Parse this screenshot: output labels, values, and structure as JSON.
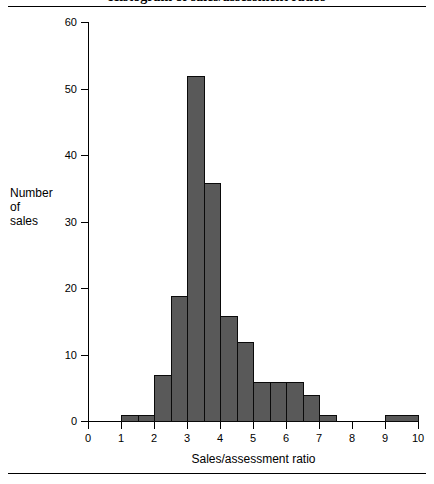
{
  "figure": {
    "title": "Histogram of sales/assessment ratios",
    "x_axis_title": "Sales/assessment ratio",
    "y_axis_title_lines": [
      "Number",
      "of",
      "sales"
    ],
    "bar_fill_color": "#595959",
    "bar_border_color": "#0a0a0a",
    "background_color": "#ffffff"
  },
  "chart_data": {
    "type": "bar",
    "title": "Histogram of sales/assessment ratios",
    "xlabel": "Sales/assessment ratio",
    "ylabel": "Number of sales",
    "xlim": [
      0,
      10
    ],
    "ylim": [
      0,
      60
    ],
    "xticks": [
      0,
      1,
      2,
      3,
      4,
      5,
      6,
      7,
      8,
      9,
      10
    ],
    "yticks": [
      0,
      10,
      20,
      30,
      40,
      50,
      60
    ],
    "grid": false,
    "legend": false,
    "bin_width": 0.5,
    "bins": [
      {
        "start": 1.0,
        "end": 1.5,
        "value": 1
      },
      {
        "start": 1.5,
        "end": 2.0,
        "value": 1
      },
      {
        "start": 2.0,
        "end": 2.5,
        "value": 7
      },
      {
        "start": 2.5,
        "end": 3.0,
        "value": 19
      },
      {
        "start": 3.0,
        "end": 3.5,
        "value": 52
      },
      {
        "start": 3.5,
        "end": 4.0,
        "value": 36
      },
      {
        "start": 4.0,
        "end": 4.5,
        "value": 16
      },
      {
        "start": 4.5,
        "end": 5.0,
        "value": 12
      },
      {
        "start": 5.0,
        "end": 5.5,
        "value": 6
      },
      {
        "start": 5.5,
        "end": 6.0,
        "value": 6
      },
      {
        "start": 6.0,
        "end": 6.5,
        "value": 6
      },
      {
        "start": 6.5,
        "end": 7.0,
        "value": 4
      },
      {
        "start": 7.0,
        "end": 7.5,
        "value": 1
      },
      {
        "start": 9.0,
        "end": 10.0,
        "value": 1
      }
    ],
    "categories": [
      "1.0-1.5",
      "1.5-2.0",
      "2.0-2.5",
      "2.5-3.0",
      "3.0-3.5",
      "3.5-4.0",
      "4.0-4.5",
      "4.5-5.0",
      "5.0-5.5",
      "5.5-6.0",
      "6.0-6.5",
      "6.5-7.0",
      "7.0-7.5",
      "9.0-10.0"
    ],
    "values": [
      1,
      1,
      7,
      19,
      52,
      36,
      16,
      12,
      6,
      6,
      6,
      4,
      1,
      1
    ]
  }
}
